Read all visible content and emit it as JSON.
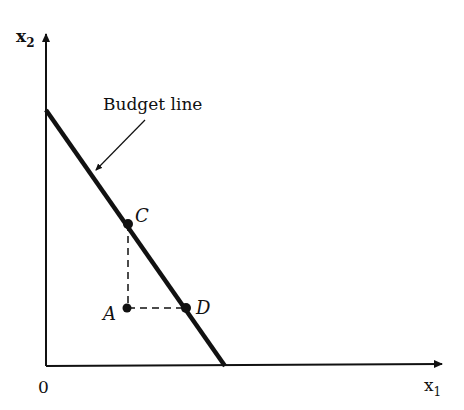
{
  "diagram": {
    "axes": {
      "x_label": "x",
      "x_sub": "1",
      "y_label": "x",
      "y_sub": "2",
      "origin_label": "0"
    },
    "budget_line": {
      "label": "Budget line"
    },
    "points": [
      {
        "id": "A",
        "label": "A"
      },
      {
        "id": "C",
        "label": "C"
      },
      {
        "id": "D",
        "label": "D"
      }
    ],
    "colors": {
      "ink": "#111111",
      "background": "#ffffff"
    }
  }
}
